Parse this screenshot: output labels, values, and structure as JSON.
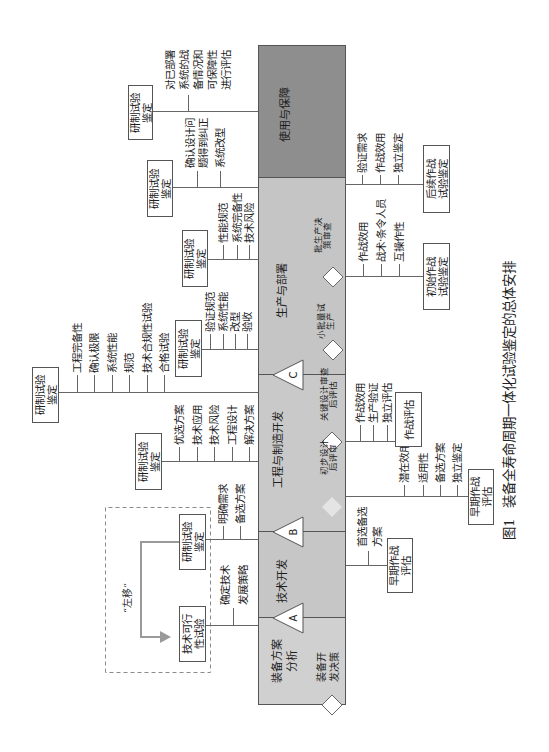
{
  "figure": {
    "caption_number": "图1",
    "caption_title": "装备全寿命周期一体化试验鉴定的总体安排"
  },
  "phases": [
    {
      "lines": [
        "装备方案",
        "分析"
      ]
    },
    {
      "lines": [
        "技术开发"
      ]
    },
    {
      "lines": [
        "工程与制造开发"
      ]
    },
    {
      "lines": [
        "生产与部署"
      ]
    },
    {
      "lines": [
        "使用与保障"
      ]
    }
  ],
  "milestones": [
    {
      "label": "A"
    },
    {
      "label": "B"
    },
    {
      "label": "C"
    }
  ],
  "decision_points": [
    {
      "lines": [
        "装备开",
        "发决策"
      ]
    },
    {
      "lines": [
        "初步设计",
        "后评审"
      ]
    },
    {
      "lines": [
        "关键设计审查",
        "后评估"
      ]
    },
    {
      "lines": [
        "小批量试",
        "生产"
      ]
    },
    {
      "lines": [
        "批生产决",
        "策审查"
      ]
    }
  ],
  "shift_left": {
    "label": "“左移”"
  },
  "developmental_test": [
    {
      "box": [
        "技术可行",
        "性试验"
      ],
      "items": [
        {
          "lines": [
            "确定技术",
            "发展策略"
          ]
        }
      ]
    },
    {
      "box": [
        "研制试验",
        "鉴定"
      ],
      "items": [
        {
          "lines": [
            "明确需求"
          ]
        },
        {
          "lines": [
            "备选方案"
          ]
        }
      ]
    },
    {
      "box": [
        "研制试验",
        "鉴定"
      ],
      "items": [
        {
          "lines": [
            "优选方案"
          ]
        },
        {
          "lines": [
            "技术应用"
          ]
        },
        {
          "lines": [
            "技术风险"
          ]
        },
        {
          "lines": [
            "工程设计"
          ]
        },
        {
          "lines": [
            "解决方案"
          ]
        }
      ]
    },
    {
      "box": [
        "研制试验",
        "鉴定"
      ],
      "items": [
        {
          "lines": [
            "工程完备性"
          ]
        },
        {
          "lines": [
            "确认极限"
          ]
        },
        {
          "lines": [
            "系统性能"
          ]
        },
        {
          "lines": [
            "规范"
          ]
        },
        {
          "lines": [
            "技术合规性试验"
          ]
        },
        {
          "lines": [
            "合格试验"
          ]
        }
      ]
    },
    {
      "box": [
        "研制试验",
        "鉴定"
      ],
      "items": [
        {
          "lines": [
            "验证规范"
          ]
        },
        {
          "lines": [
            "系统性能"
          ]
        },
        {
          "lines": [
            "改型"
          ]
        },
        {
          "lines": [
            "验收"
          ]
        }
      ]
    },
    {
      "box": [
        "研制试验",
        "鉴定"
      ],
      "items": [
        {
          "lines": [
            "性能规范"
          ]
        },
        {
          "lines": [
            "系统完备性"
          ]
        },
        {
          "lines": [
            "技术风险"
          ]
        }
      ]
    },
    {
      "box": [
        "研制试验",
        "鉴定"
      ],
      "items": [
        {
          "lines": [
            "确认设计问",
            "题得到纠正"
          ]
        },
        {
          "lines": [
            "系统改型"
          ]
        }
      ]
    },
    {
      "box": [
        "研制试验",
        "鉴定"
      ],
      "items": [
        {
          "lines": [
            "对已部署",
            "系统的战",
            "备情况和",
            "可保障性",
            "进行评估"
          ]
        }
      ]
    }
  ],
  "operational_test": [
    {
      "box": [
        "早期作战",
        "评估"
      ],
      "items": [
        {
          "lines": [
            "首选备选",
            "方案"
          ]
        }
      ]
    },
    {
      "box": [
        "早期作战",
        "评估"
      ],
      "items": [
        {
          "lines": [
            "潜在效用"
          ]
        },
        {
          "lines": [
            "适用性"
          ]
        },
        {
          "lines": [
            "备选方案"
          ]
        },
        {
          "lines": [
            "独立鉴定"
          ]
        }
      ]
    },
    {
      "box": [
        "作战评估"
      ],
      "items": [
        {
          "lines": [
            "作战效用"
          ]
        },
        {
          "lines": [
            "生产验证"
          ]
        },
        {
          "lines": [
            "独立评估"
          ]
        }
      ]
    },
    {
      "box": [
        "初始作战",
        "试验鉴定"
      ],
      "items": [
        {
          "lines": [
            "作战效用"
          ]
        },
        {
          "lines": [
            "战术·条令人员"
          ]
        },
        {
          "lines": [
            "互操作性"
          ]
        }
      ]
    },
    {
      "box": [
        "后续作战",
        "试验鉴定"
      ],
      "items": [
        {
          "lines": [
            "验证需求"
          ]
        },
        {
          "lines": [
            "作战效用"
          ]
        },
        {
          "lines": [
            "独立鉴定"
          ]
        }
      ]
    }
  ],
  "colors": {
    "phase0": "#d0d0d0",
    "phase1": "#c6c6c6",
    "phase2": "#c9c9c9",
    "phase3": "#c5c5c5",
    "phase4": "#8e8e8e",
    "border": "#555555",
    "line": "#666666",
    "arrow": "#9a9a9a",
    "text": "#1d1d1d"
  }
}
